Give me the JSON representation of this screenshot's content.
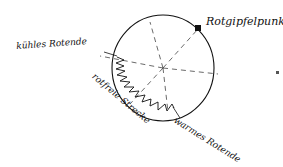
{
  "diagram": {
    "type": "hand-drawn color circle",
    "labels": {
      "peak": "Rotgipfelpunkt",
      "cool_end": "kühles Rotende",
      "red_free": "rotfreie Strecke",
      "warm_end": "warmes Rotende"
    },
    "colors": {
      "ink": "#111111",
      "background": "#ffffff"
    }
  }
}
